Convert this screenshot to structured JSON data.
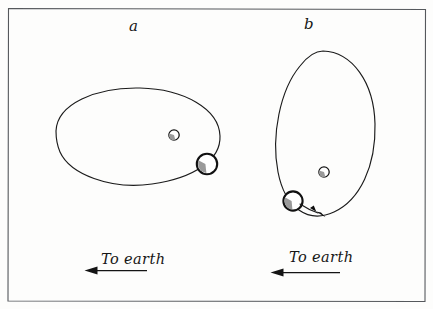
{
  "figure": {
    "kind": "hand-drawn scientific line diagram",
    "width": 433,
    "height": 309,
    "background_color": "#fdfdfc",
    "ink_color": "#1b1b1b",
    "frame_color": "#55585c",
    "shading_color": "#9a9a9a"
  },
  "panels": [
    {
      "id": "a",
      "label": "a",
      "caption": "To earth",
      "caption_arrow_direction": "left",
      "orbit": {
        "shape": "ellipse",
        "orientation": "horizontal",
        "center_x": 137,
        "center_y": 137,
        "radius_x": 83,
        "radius_y": 50,
        "rotation_deg": -4
      },
      "bodies": [
        {
          "name": "small-body",
          "role": "primary",
          "center_x": 174,
          "center_y": 135,
          "radius": 5.2,
          "shaded": true,
          "shade_side": "lower-left"
        },
        {
          "name": "large-body",
          "role": "satellite",
          "center_x": 207,
          "center_y": 164,
          "radius": 10.2,
          "shaded": true,
          "shade_side": "lower-left",
          "on_orbit": true
        }
      ],
      "motion_arrow": false
    },
    {
      "id": "b",
      "label": "b",
      "caption": "To earth",
      "caption_arrow_direction": "left",
      "orbit": {
        "shape": "ellipse",
        "orientation": "vertical",
        "center_x": 325,
        "center_y": 132,
        "radius_x": 50,
        "radius_y": 83,
        "rotation_deg": 6
      },
      "bodies": [
        {
          "name": "small-body",
          "role": "primary",
          "center_x": 324,
          "center_y": 172,
          "radius": 5.2,
          "shaded": true,
          "shade_side": "lower-left"
        },
        {
          "name": "large-body",
          "role": "satellite",
          "center_x": 293,
          "center_y": 201,
          "radius": 9.6,
          "shaded": true,
          "shade_side": "lower-left",
          "on_orbit": true
        }
      ],
      "motion_arrow": true,
      "motion_arrow_tip_x": 324,
      "motion_arrow_tip_y": 216,
      "motion_arrow_direction": "down-right along orbit"
    }
  ],
  "frame": {
    "name": "figure-border",
    "left": 7,
    "top": 8,
    "right": 426,
    "bottom": 302
  }
}
